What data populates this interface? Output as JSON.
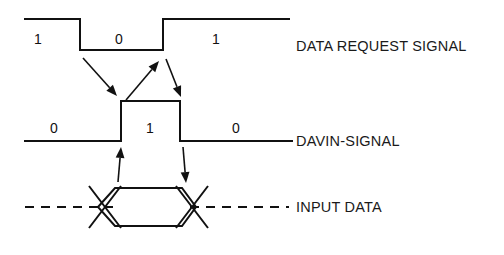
{
  "diagram": {
    "kind": "digital-timing-diagram",
    "background_color": "#ffffff",
    "line_color": "#111111",
    "signals": [
      {
        "id": "data-request-signal",
        "name": "DATA REQUEST SIGNAL",
        "name_x": 296,
        "name_y": 51,
        "style": "two-level",
        "high_y": 19,
        "low_y": 50,
        "x_start": 25,
        "x_end": 289,
        "transitions": [
          {
            "x": 80,
            "type": "falling"
          },
          {
            "x": 163,
            "type": "rising"
          }
        ],
        "bit_labels": [
          {
            "value": "1",
            "x": 38,
            "y": 44
          },
          {
            "value": "0",
            "x": 119,
            "y": 44
          },
          {
            "value": "1",
            "x": 216,
            "y": 44
          }
        ]
      },
      {
        "id": "davin-signal",
        "name": "DAVIN-SIGNAL",
        "name_x": 296,
        "name_y": 146,
        "style": "two-level",
        "high_y": 101,
        "low_y": 141,
        "x_start": 25,
        "x_end": 292,
        "transitions": [
          {
            "x": 121,
            "type": "rising"
          },
          {
            "x": 180,
            "type": "falling"
          }
        ],
        "bit_labels": [
          {
            "value": "0",
            "x": 54,
            "y": 133
          },
          {
            "value": "1",
            "x": 150,
            "y": 133
          },
          {
            "value": "0",
            "x": 236,
            "y": 133
          }
        ]
      },
      {
        "id": "input-data",
        "name": "INPUT DATA",
        "name_x": 296,
        "name_y": 212,
        "style": "bus",
        "center_y": 207,
        "top_y": 188,
        "bottom_y": 226,
        "x_start": 25,
        "x_end": 289,
        "valid_start_x": 98,
        "valid_end_x": 196,
        "cross_left_x": 105,
        "cross_right_x": 192,
        "bit_labels": []
      }
    ],
    "annotation_arrows": [
      {
        "id": "req-fall-to-davin-rise",
        "from": {
          "x": 83,
          "y": 58
        },
        "to": {
          "x": 117,
          "y": 96
        }
      },
      {
        "id": "davin-rise-to-req-rise",
        "from": {
          "x": 126,
          "y": 100
        },
        "to": {
          "x": 159,
          "y": 61
        }
      },
      {
        "id": "req-rise-to-davin-fall",
        "from": {
          "x": 166,
          "y": 59
        },
        "to": {
          "x": 181,
          "y": 97
        }
      },
      {
        "id": "data-start-to-davin-rise",
        "from": {
          "x": 118,
          "y": 182
        },
        "to": {
          "x": 121,
          "y": 147
        }
      },
      {
        "id": "davin-fall-to-data-end",
        "from": {
          "x": 183,
          "y": 147
        },
        "to": {
          "x": 186,
          "y": 183
        }
      }
    ]
  }
}
